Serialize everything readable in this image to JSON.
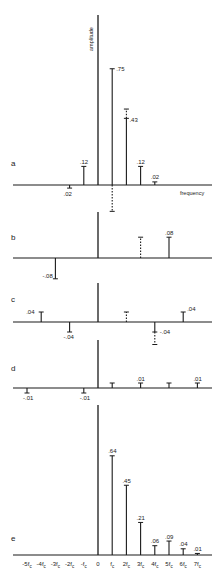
{
  "figure": {
    "y_axis_label": "amplitude",
    "x_axis_label": "frequency",
    "colors": {
      "ink": "#1a1a1a",
      "background": "#ffffff"
    },
    "tick_labels": [
      "-5fc",
      "-4fc",
      "-3fc",
      "-2fc",
      "-fc",
      "0",
      "fc",
      "2fc",
      "3fc",
      "4fc",
      "5fc",
      "6fc",
      "7fc"
    ]
  },
  "chart_data": [
    {
      "type": "stem",
      "panel": "a",
      "categories": [
        "-2fc",
        "-fc",
        "0",
        "fc",
        "2fc",
        "3fc",
        "4fc"
      ],
      "stems": [
        {
          "k": -2,
          "value": -0.02,
          "label": ".02",
          "style": "solid"
        },
        {
          "k": -1,
          "value": 0.12,
          "label": ".12",
          "style": "solid"
        },
        {
          "k": 1,
          "value": 0.75,
          "label": ".75",
          "style": "solid"
        },
        {
          "k": 1,
          "value": -0.17,
          "label": "",
          "style": "dashed"
        },
        {
          "k": 2,
          "value": 0.43,
          "label": ".43",
          "style": "solid"
        },
        {
          "k": 2,
          "value": 0.49,
          "label": "",
          "style": "dashed"
        },
        {
          "k": 3,
          "value": 0.12,
          "label": ".12",
          "style": "solid"
        },
        {
          "k": 4,
          "value": 0.02,
          "label": ".02",
          "style": "solid"
        }
      ],
      "xlabel": "frequency",
      "ylabel": "amplitude"
    },
    {
      "type": "stem",
      "panel": "b",
      "stems": [
        {
          "k": -3,
          "value": -0.08,
          "label": "-.08",
          "style": "solid"
        },
        {
          "k": 3,
          "value": 0.08,
          "label": "",
          "style": "dashed"
        },
        {
          "k": 5,
          "value": 0.08,
          "label": ".08",
          "style": "solid"
        }
      ]
    },
    {
      "type": "stem",
      "panel": "c",
      "stems": [
        {
          "k": -4,
          "value": 0.04,
          "label": ".04",
          "style": "solid"
        },
        {
          "k": -2,
          "value": -0.04,
          "label": "-.04",
          "style": "solid"
        },
        {
          "k": 2,
          "value": 0.04,
          "label": "",
          "style": "dashed"
        },
        {
          "k": 4,
          "value": -0.04,
          "label": "-.04",
          "style": "solid"
        },
        {
          "k": 4,
          "value": -0.09,
          "label": "",
          "style": "dashed"
        },
        {
          "k": 6,
          "value": 0.04,
          "label": ".04",
          "style": "solid"
        }
      ]
    },
    {
      "type": "stem",
      "panel": "d",
      "stems": [
        {
          "k": -5,
          "value": -0.01,
          "label": "-.01",
          "style": "solid"
        },
        {
          "k": -1,
          "value": -0.01,
          "label": "-.01",
          "style": "solid"
        },
        {
          "k": 1,
          "value": 0.01,
          "label": "",
          "style": "solid"
        },
        {
          "k": 3,
          "value": 0.01,
          "label": ".01",
          "style": "solid"
        },
        {
          "k": 5,
          "value": 0.01,
          "label": "",
          "style": "solid"
        },
        {
          "k": 7,
          "value": 0.01,
          "label": ".01",
          "style": "solid"
        }
      ]
    },
    {
      "type": "stem",
      "panel": "e",
      "categories": [
        "-5fc",
        "-4fc",
        "-3fc",
        "-2fc",
        "-fc",
        "0",
        "fc",
        "2fc",
        "3fc",
        "4fc",
        "5fc",
        "6fc",
        "7fc"
      ],
      "stems": [
        {
          "k": 1,
          "value": 0.64,
          "label": ".64",
          "style": "solid"
        },
        {
          "k": 2,
          "value": 0.45,
          "label": ".45",
          "style": "solid"
        },
        {
          "k": 3,
          "value": 0.21,
          "label": ".21",
          "style": "solid"
        },
        {
          "k": 4,
          "value": 0.06,
          "label": ".06",
          "style": "solid"
        },
        {
          "k": 5,
          "value": 0.09,
          "label": ".09",
          "style": "solid"
        },
        {
          "k": 6,
          "value": 0.04,
          "label": ".04",
          "style": "solid"
        },
        {
          "k": 7,
          "value": 0.01,
          "label": ".01",
          "style": "solid"
        }
      ]
    }
  ],
  "layout": {
    "x0": 98,
    "dx": 14.2,
    "x_left": 13,
    "x_right": 212,
    "panels": [
      {
        "id": "a",
        "letter": "a",
        "axis_top": 15,
        "baseline": 185,
        "scale": 155,
        "letter_x": 11,
        "letter_y": 166
      },
      {
        "id": "b",
        "letter": "b",
        "axis_top": 212,
        "baseline": 258,
        "scale": 260,
        "letter_x": 11,
        "letter_y": 240
      },
      {
        "id": "c",
        "letter": "c",
        "axis_top": 283,
        "baseline": 322,
        "scale": 250,
        "letter_x": 11,
        "letter_y": 302
      },
      {
        "id": "d",
        "letter": "d",
        "axis_top": 340,
        "baseline": 388,
        "scale": 500,
        "letter_x": 11,
        "letter_y": 371
      },
      {
        "id": "e",
        "letter": "e",
        "axis_top": 405,
        "baseline": 555,
        "scale": 155,
        "letter_x": 11,
        "letter_y": 541
      }
    ]
  }
}
